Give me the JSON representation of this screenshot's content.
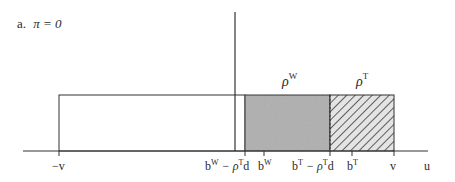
{
  "panel": {
    "label": "a.",
    "condition": "π = 0"
  },
  "axis": {
    "x_label": "u"
  },
  "regions": [
    {
      "name": "white-region",
      "label": "",
      "fill": "#ffffff"
    },
    {
      "name": "rho-w-region",
      "label": "ρ",
      "sup": "W",
      "fill": "#b8b8b8"
    },
    {
      "name": "rho-t-region",
      "label": "ρ",
      "sup": "T",
      "fill": "hatched"
    }
  ],
  "ticks": [
    {
      "base": "−v",
      "sup": "",
      "tail": ""
    },
    {
      "base": "b",
      "sup": "W",
      "tail": " − ρ",
      "sup2": "T",
      "tail2": "d"
    },
    {
      "base": "b",
      "sup": "W",
      "tail": ""
    },
    {
      "base": "b",
      "sup": "T",
      "tail": " − ρ",
      "sup2": "T",
      "tail2": "d"
    },
    {
      "base": "b",
      "sup": "T",
      "tail": ""
    },
    {
      "base": "v",
      "sup": "",
      "tail": ""
    }
  ],
  "colors": {
    "line": "#333333",
    "shade": "#b5b5b5",
    "hatch": "#3a3a3a"
  }
}
